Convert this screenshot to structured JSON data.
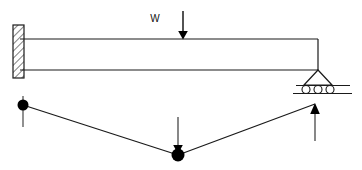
{
  "figure": {
    "type": "structural-engineering-diagram",
    "background_color": "#ffffff",
    "line_color": "#1a1a1a",
    "fill_color": "#000000"
  },
  "labels": {
    "point_load": "W"
  },
  "beam_diagram": {
    "name": "beam-elevation",
    "beam": {
      "x_left": 20,
      "x_right": 318,
      "y_top": 39,
      "y_bottom": 70,
      "depth": 31,
      "span": 298
    },
    "fixed_support": {
      "name": "fixed-support-wall",
      "x": 13,
      "y": 25,
      "width": 11,
      "height": 53,
      "hatch": "diagonal",
      "side": "left"
    },
    "roller_support": {
      "name": "roller-support",
      "apex_x": 318,
      "apex_y": 70,
      "triangle_base_y": 85,
      "triangle_half_width": 14,
      "rollers": 3,
      "roller_radius": 4,
      "ground_y": 92,
      "ground_x_left": 293,
      "ground_x_right": 352,
      "side": "right"
    },
    "point_load": {
      "name": "point-load-arrow",
      "label": "W",
      "label_x": 155,
      "label_y": 22,
      "arrow_x": 183,
      "arrow_y_start": 11,
      "arrow_y_end": 39,
      "direction": "down"
    }
  },
  "force_diagram": {
    "name": "reaction-free-body-diagram",
    "nodes": [
      {
        "name": "left-node",
        "x": 23,
        "y": 105,
        "radius": 5.5,
        "filled": true
      },
      {
        "name": "center-node",
        "x": 178,
        "y": 155,
        "radius": 6.5,
        "filled": true
      }
    ],
    "segments": [
      {
        "name": "left-segment",
        "x1": 23,
        "y1": 105,
        "x2": 178,
        "y2": 155
      },
      {
        "name": "right-segment",
        "x1": 178,
        "y1": 155,
        "x2": 315,
        "y2": 104
      }
    ],
    "arrows": [
      {
        "name": "left-reaction-arrow",
        "x": 23,
        "y_start": 96,
        "y_end": 127,
        "direction": "down",
        "head": false
      },
      {
        "name": "center-load-arrow",
        "x": 178,
        "y_start": 117,
        "y_end": 155,
        "direction": "down",
        "head": true
      },
      {
        "name": "right-reaction-arrow",
        "x": 315,
        "y_start": 141,
        "y_end": 103,
        "direction": "up",
        "head": true
      }
    ]
  }
}
